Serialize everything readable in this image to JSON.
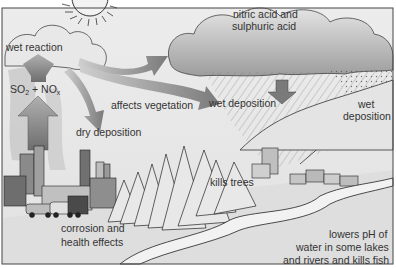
{
  "diagram": {
    "labels": {
      "wet_reaction": "wet reaction",
      "so2": "SO",
      "so2_sub": "2",
      "plus": " + NO",
      "nox_sub": "x",
      "affects_vegetation": "affects vegetation",
      "dry_deposition": "dry deposition",
      "nitric_line1": "nitric acid and",
      "nitric_line2": "sulphuric acid",
      "wet_deposition_1": "wet deposition",
      "wet_deposition_2_line1": "wet",
      "wet_deposition_2_line2": "deposition",
      "kills_trees": "kills trees",
      "corrosion_line1": "corrosion and",
      "corrosion_line2": "health effects",
      "lowers_line1": "lowers pH of",
      "lowers_line2": "water in some lakes",
      "lowers_line3": "and rivers and kills fish"
    },
    "colors": {
      "background": "#e6e6e6",
      "cloud": "#d2d2d2",
      "cloud_dark": "#a8a8a8",
      "arrow": "#8a8a8a",
      "ground": "#dcdcdc",
      "river": "#f0f0f0",
      "ink": "#2a2a2a"
    }
  }
}
